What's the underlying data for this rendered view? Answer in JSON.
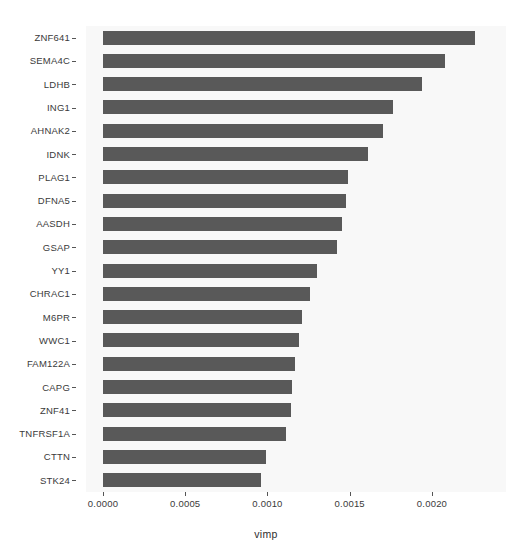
{
  "chart_data": {
    "type": "bar",
    "orientation": "horizontal",
    "title": "",
    "xlabel": "vimp",
    "ylabel": "",
    "xlim": [
      0.0,
      0.00245
    ],
    "xticks": [
      0.0,
      0.0005,
      0.001,
      0.0015,
      0.002
    ],
    "xtick_labels": [
      "0.0000",
      "0.0005",
      "0.0010",
      "0.0015",
      "0.0020"
    ],
    "grid": false,
    "legend": null,
    "bar_color": "#595959",
    "panel_color": "#f2f2f2",
    "categories": [
      "ZNF641",
      "SEMA4C",
      "LDHB",
      "ING1",
      "AHNAK2",
      "IDNK",
      "PLAG1",
      "DFNA5",
      "AASDH",
      "GSAP",
      "YY1",
      "CHRAC1",
      "M6PR",
      "WWC1",
      "FAM122A",
      "CAPG",
      "ZNF41",
      "TNFRSF1A",
      "CTTN",
      "STK24"
    ],
    "values": [
      0.00226,
      0.00208,
      0.00194,
      0.00176,
      0.0017,
      0.00161,
      0.00149,
      0.00148,
      0.00145,
      0.00142,
      0.0013,
      0.00126,
      0.00121,
      0.00119,
      0.00117,
      0.00115,
      0.00114,
      0.00111,
      0.00099,
      0.00096
    ]
  }
}
